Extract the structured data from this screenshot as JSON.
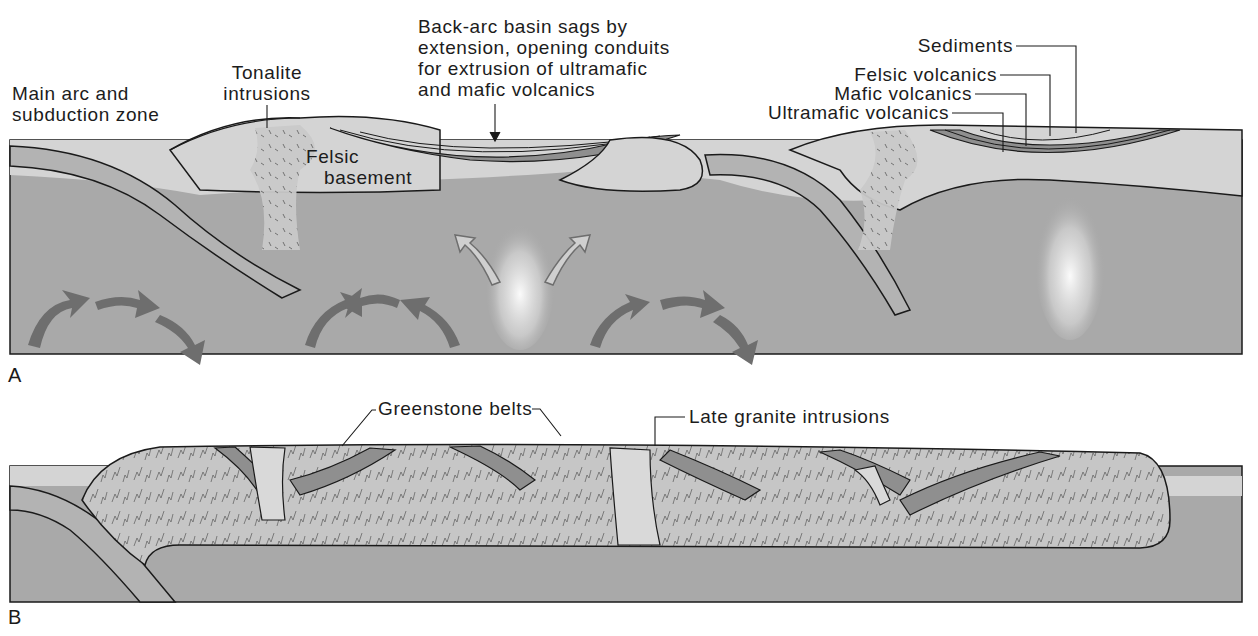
{
  "figure": {
    "panels": [
      {
        "letter": "A",
        "labels": {
          "main_arc_line1": "Main arc and",
          "main_arc_line2": "subduction zone",
          "tonalite_line1": "Tonalite",
          "tonalite_line2": "intrusions",
          "felsic_basement_line1": "Felsic",
          "felsic_basement_line2": "basement",
          "back_arc_line1": "Back-arc basin sags by",
          "back_arc_line2": "extension, opening conduits",
          "back_arc_line3": "for extrusion of ultramafic",
          "back_arc_line4": "and mafic volcanics",
          "sediments": "Sediments",
          "felsic_volcanics": "Felsic volcanics",
          "mafic_volcanics": "Mafic volcanics",
          "ultramafic_volcanics": "Ultramafic volcanics"
        }
      },
      {
        "letter": "B",
        "labels": {
          "greenstone_belts": "Greenstone belts",
          "late_granite": "Late granite intrusions"
        }
      }
    ],
    "colors": {
      "mantle": "#a9a9a9",
      "crust_light": "#d4d4d4",
      "volcanic_dark": "#8f8f8f",
      "slab": "#b3b3b3",
      "arrow": "#6e6e6e",
      "outline": "#1a1a1a"
    }
  }
}
